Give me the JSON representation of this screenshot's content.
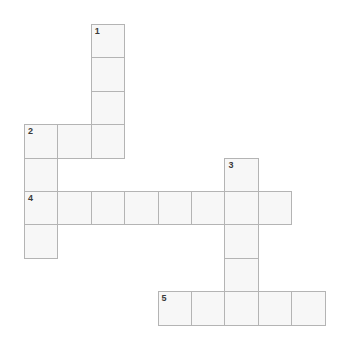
{
  "puzzle": {
    "title": "Crossword Grid",
    "grid": {
      "origin_x": 24,
      "origin_y": 24,
      "cell_size": 33.4,
      "columns": 9,
      "rows": 9,
      "cell_fill": "#f7f7f7",
      "border_color": "#b4b4b4",
      "background": "#ffffff",
      "number_color": "#3a3a3a"
    },
    "entries": [
      {
        "number": "1",
        "direction": "down",
        "col": 2,
        "row": 0,
        "length": 4
      },
      {
        "number": "2",
        "direction": "across",
        "col": 0,
        "row": 3,
        "length": 3
      },
      {
        "number": "2",
        "direction": "down",
        "col": 0,
        "row": 3,
        "length": 4
      },
      {
        "number": "3",
        "direction": "down",
        "col": 6,
        "row": 4,
        "length": 5
      },
      {
        "number": "4",
        "direction": "across",
        "col": 0,
        "row": 5,
        "length": 8
      },
      {
        "number": "5",
        "direction": "across",
        "col": 4,
        "row": 8,
        "length": 5
      }
    ],
    "cells": [
      {
        "col": 2,
        "row": 0,
        "number": "1",
        "letter": ""
      },
      {
        "col": 2,
        "row": 1,
        "number": "",
        "letter": ""
      },
      {
        "col": 2,
        "row": 2,
        "number": "",
        "letter": ""
      },
      {
        "col": 0,
        "row": 3,
        "number": "2",
        "letter": ""
      },
      {
        "col": 1,
        "row": 3,
        "number": "",
        "letter": ""
      },
      {
        "col": 2,
        "row": 3,
        "number": "",
        "letter": ""
      },
      {
        "col": 0,
        "row": 4,
        "number": "",
        "letter": ""
      },
      {
        "col": 6,
        "row": 4,
        "number": "3",
        "letter": ""
      },
      {
        "col": 0,
        "row": 5,
        "number": "4",
        "letter": ""
      },
      {
        "col": 1,
        "row": 5,
        "number": "",
        "letter": ""
      },
      {
        "col": 2,
        "row": 5,
        "number": "",
        "letter": ""
      },
      {
        "col": 3,
        "row": 5,
        "number": "",
        "letter": ""
      },
      {
        "col": 4,
        "row": 5,
        "number": "",
        "letter": ""
      },
      {
        "col": 5,
        "row": 5,
        "number": "",
        "letter": ""
      },
      {
        "col": 6,
        "row": 5,
        "number": "",
        "letter": ""
      },
      {
        "col": 7,
        "row": 5,
        "number": "",
        "letter": ""
      },
      {
        "col": 0,
        "row": 6,
        "number": "",
        "letter": ""
      },
      {
        "col": 6,
        "row": 6,
        "number": "",
        "letter": ""
      },
      {
        "col": 6,
        "row": 7,
        "number": "",
        "letter": ""
      },
      {
        "col": 4,
        "row": 8,
        "number": "5",
        "letter": ""
      },
      {
        "col": 5,
        "row": 8,
        "number": "",
        "letter": ""
      },
      {
        "col": 6,
        "row": 8,
        "number": "",
        "letter": ""
      },
      {
        "col": 7,
        "row": 8,
        "number": "",
        "letter": ""
      },
      {
        "col": 8,
        "row": 8,
        "number": "",
        "letter": ""
      }
    ]
  }
}
